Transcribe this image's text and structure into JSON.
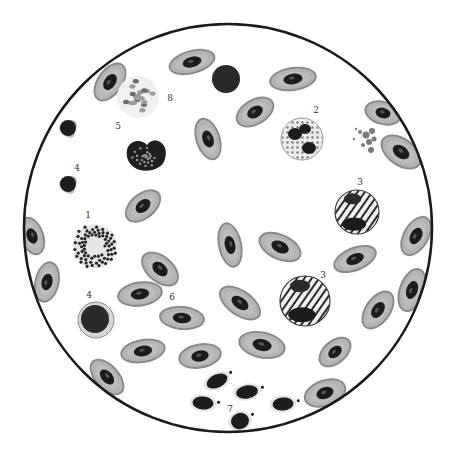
{
  "figure": {
    "field": {
      "cx": 228,
      "cy": 228,
      "r": 204,
      "stroke": "#1a1a1a",
      "stroke_width": 2.5
    },
    "colors": {
      "rbc_fill": "#b4b4b4",
      "rbc_rim": "#8a8a8a",
      "nucleus": "#1c1c1c",
      "granule": "#262626",
      "pale": "#c9c9c9",
      "background": "#ffffff"
    },
    "labels": [
      {
        "text": "8",
        "x": 170,
        "y": 101
      },
      {
        "text": "5",
        "x": 118,
        "y": 129
      },
      {
        "text": "2",
        "x": 316,
        "y": 113
      },
      {
        "text": "4",
        "x": 77,
        "y": 171
      },
      {
        "text": "3",
        "x": 360,
        "y": 185
      },
      {
        "text": "1",
        "x": 88,
        "y": 218
      },
      {
        "text": "4",
        "x": 89,
        "y": 298
      },
      {
        "text": "6",
        "x": 172,
        "y": 300
      },
      {
        "text": "3",
        "x": 323,
        "y": 278
      },
      {
        "text": "7",
        "x": 230,
        "y": 412
      }
    ],
    "erythrocytes": [
      {
        "x": 110,
        "y": 82,
        "w": 44,
        "h": 26,
        "rot": -55
      },
      {
        "x": 192,
        "y": 62,
        "w": 48,
        "h": 24,
        "rot": -15
      },
      {
        "x": 293,
        "y": 79,
        "w": 48,
        "h": 24,
        "rot": -8
      },
      {
        "x": 255,
        "y": 112,
        "w": 42,
        "h": 26,
        "rot": -30
      },
      {
        "x": 208,
        "y": 139,
        "w": 44,
        "h": 25,
        "rot": 72
      },
      {
        "x": 383,
        "y": 113,
        "w": 38,
        "h": 24,
        "rot": 15
      },
      {
        "x": 401,
        "y": 152,
        "w": 46,
        "h": 28,
        "rot": 35
      },
      {
        "x": 143,
        "y": 206,
        "w": 42,
        "h": 26,
        "rot": -40
      },
      {
        "x": 230,
        "y": 245,
        "w": 46,
        "h": 24,
        "rot": 78
      },
      {
        "x": 280,
        "y": 247,
        "w": 46,
        "h": 26,
        "rot": 25
      },
      {
        "x": 355,
        "y": 259,
        "w": 46,
        "h": 24,
        "rot": -22
      },
      {
        "x": 416,
        "y": 236,
        "w": 44,
        "h": 26,
        "rot": -60
      },
      {
        "x": 32,
        "y": 236,
        "w": 40,
        "h": 24,
        "rot": 70
      },
      {
        "x": 47,
        "y": 282,
        "w": 42,
        "h": 25,
        "rot": -78
      },
      {
        "x": 160,
        "y": 269,
        "w": 44,
        "h": 27,
        "rot": 40
      },
      {
        "x": 140,
        "y": 294,
        "w": 46,
        "h": 25,
        "rot": -8
      },
      {
        "x": 182,
        "y": 318,
        "w": 46,
        "h": 24,
        "rot": 5
      },
      {
        "x": 240,
        "y": 303,
        "w": 48,
        "h": 26,
        "rot": 35
      },
      {
        "x": 378,
        "y": 310,
        "w": 44,
        "h": 26,
        "rot": -55
      },
      {
        "x": 412,
        "y": 290,
        "w": 46,
        "h": 26,
        "rot": -70
      },
      {
        "x": 143,
        "y": 351,
        "w": 46,
        "h": 24,
        "rot": -10
      },
      {
        "x": 200,
        "y": 356,
        "w": 44,
        "h": 25,
        "rot": -10
      },
      {
        "x": 262,
        "y": 345,
        "w": 48,
        "h": 27,
        "rot": 12
      },
      {
        "x": 335,
        "y": 352,
        "w": 38,
        "h": 24,
        "rot": -40
      },
      {
        "x": 107,
        "y": 377,
        "w": 44,
        "h": 25,
        "rot": 48
      },
      {
        "x": 325,
        "y": 393,
        "w": 44,
        "h": 27,
        "rot": -20
      }
    ],
    "special_cells": {
      "lymphocyte_top": {
        "x": 226,
        "y": 79,
        "r": 14
      },
      "cell_1_granular": {
        "x": 95,
        "y": 246,
        "r": 22
      },
      "cell_2_granulocyte": {
        "x": 302,
        "y": 139,
        "r": 21
      },
      "cell_3_upper": {
        "x": 357,
        "y": 212,
        "r": 22
      },
      "cell_3_lower": {
        "x": 305,
        "y": 301,
        "r": 25
      },
      "cell_4_small_a": {
        "x": 68,
        "y": 128,
        "r": 10
      },
      "cell_4_small_b": {
        "x": 68,
        "y": 184,
        "r": 10
      },
      "cell_4_round": {
        "x": 96,
        "y": 320,
        "r": 18
      },
      "cell_5_heart": {
        "x": 146,
        "y": 155,
        "r": 21
      },
      "cell_8_pale": {
        "x": 138,
        "y": 97,
        "r": 21
      },
      "platelet_cluster": {
        "x": 366,
        "y": 135
      }
    },
    "thrombocytes": [
      {
        "x": 217,
        "y": 381,
        "w": 22,
        "h": 13,
        "rot": -25
      },
      {
        "x": 247,
        "y": 392,
        "w": 22,
        "h": 13,
        "rot": -10
      },
      {
        "x": 203,
        "y": 403,
        "w": 21,
        "h": 13,
        "rot": 5
      },
      {
        "x": 283,
        "y": 404,
        "w": 21,
        "h": 13,
        "rot": -5
      },
      {
        "x": 240,
        "y": 421,
        "w": 18,
        "h": 16,
        "rot": -20
      }
    ]
  }
}
